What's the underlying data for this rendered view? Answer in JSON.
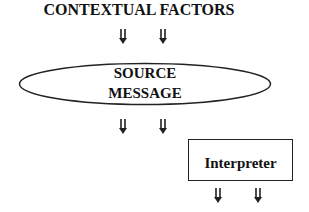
{
  "diagram": {
    "title": "CONTEXTUAL FACTORS",
    "source_node": {
      "line1": "SOURCE",
      "line2": "MESSAGE",
      "shape": "ellipse"
    },
    "interpreter_node": {
      "label": "Interpreter",
      "shape": "rectangle"
    },
    "arrows": [
      {
        "from": "CONTEXTUAL FACTORS",
        "to": "SOURCE MESSAGE",
        "count": 2,
        "icon": "double-shaft-down-arrow-icon"
      },
      {
        "from": "SOURCE MESSAGE",
        "to": "downstream",
        "count": 2,
        "icon": "double-shaft-down-arrow-icon"
      },
      {
        "from": "Interpreter",
        "to": "downstream",
        "count": 2,
        "icon": "double-shaft-down-arrow-icon"
      }
    ],
    "colors": {
      "stroke": "#222222",
      "text": "#111111",
      "background": "#ffffff"
    }
  }
}
